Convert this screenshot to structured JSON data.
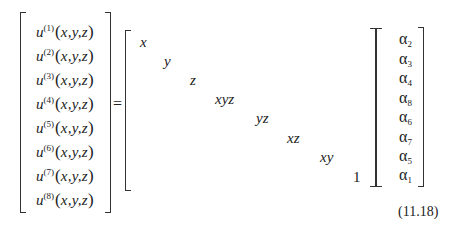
{
  "equation": {
    "number": "(11.18)",
    "equals": "=",
    "lhs": {
      "rows": [
        {
          "symbol": "u",
          "superscript": "(1)",
          "args": "x,y,z"
        },
        {
          "symbol": "u",
          "superscript": "(2)",
          "args": "x,y,z"
        },
        {
          "symbol": "u",
          "superscript": "(3)",
          "args": "x,y,z"
        },
        {
          "symbol": "u",
          "superscript": "(4)",
          "args": "x,y,z"
        },
        {
          "symbol": "u",
          "superscript": "(5)",
          "args": "x,y,z"
        },
        {
          "symbol": "u",
          "superscript": "(6)",
          "args": "x,y,z"
        },
        {
          "symbol": "u",
          "superscript": "(7)",
          "args": "x,y,z"
        },
        {
          "symbol": "u",
          "superscript": "(8)",
          "args": "x,y,z"
        }
      ]
    },
    "matrix": {
      "diagonal": [
        "x",
        "y",
        "z",
        "xyz",
        "yz",
        "xz",
        "xy",
        "1"
      ]
    },
    "vector": {
      "symbol": "α",
      "subscripts": [
        "2",
        "3",
        "4",
        "8",
        "6",
        "7",
        "5",
        "1"
      ]
    },
    "paren_open": "(",
    "paren_close": ")"
  }
}
